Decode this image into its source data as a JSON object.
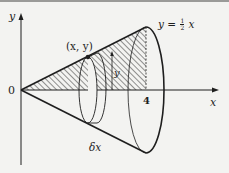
{
  "figure": {
    "type": "solid-of-revolution",
    "colors": {
      "ink": "#1e1e1e",
      "background": "#f3f3f1",
      "hatch": "#2a2a2a"
    }
  },
  "labels": {
    "y_axis": "y",
    "x_axis": "x",
    "origin": "0",
    "x_tick": "4",
    "point": "(x, y)",
    "curve_equation_lhs": "y = ",
    "curve_equation_frac_num": "1",
    "curve_equation_frac_den": "2",
    "curve_equation_rhs": " x",
    "radius": "y",
    "thickness": "δx"
  }
}
